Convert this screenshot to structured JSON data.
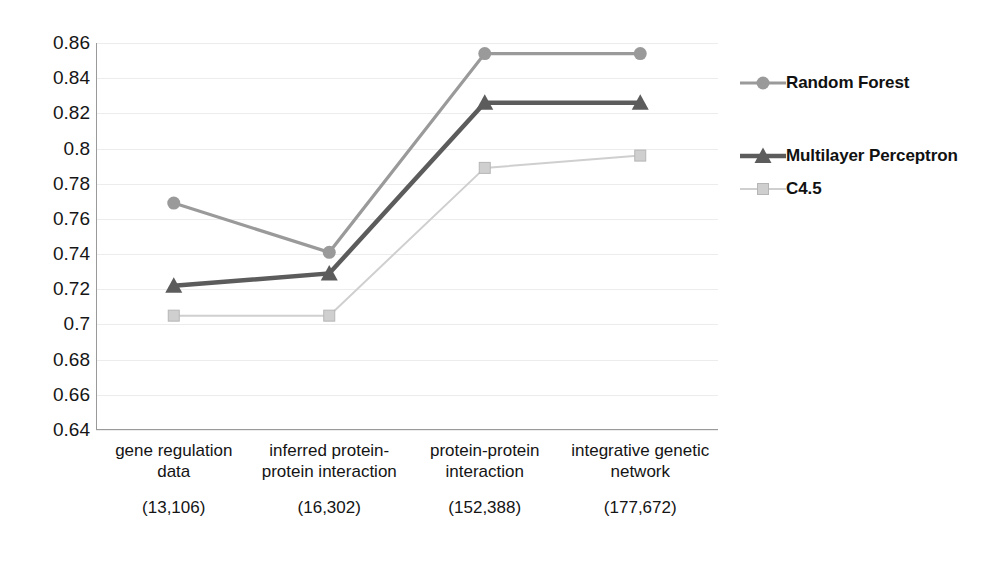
{
  "chart_data": {
    "type": "line",
    "title": "",
    "xlabel": "",
    "ylabel": "",
    "ylim": [
      0.64,
      0.86
    ],
    "yticks": [
      "0.86",
      "0.84",
      "0.82",
      "0.8",
      "0.78",
      "0.76",
      "0.74",
      "0.72",
      "0.7",
      "0.68",
      "0.66",
      "0.64"
    ],
    "ytick_values": [
      0.86,
      0.84,
      0.82,
      0.8,
      0.78,
      0.76,
      0.74,
      0.72,
      0.7,
      0.68,
      0.66,
      0.64
    ],
    "grid": true,
    "legend_position": "right",
    "categories": [
      "gene regulation data",
      "inferred protein-protein interaction",
      "protein-protein interaction",
      "integrative genetic network"
    ],
    "category_labels": [
      {
        "name": "gene regulation data",
        "count": "(13,106)"
      },
      {
        "name": "inferred protein-protein interaction",
        "count": "(16,302)"
      },
      {
        "name": "protein-protein interaction",
        "count": "(152,388)"
      },
      {
        "name": "integrative genetic network",
        "count": "(177,672)"
      }
    ],
    "series": [
      {
        "name": "Random Forest",
        "marker": "circle",
        "color": "#9a9a9a",
        "values": [
          0.769,
          0.741,
          0.854,
          0.854
        ]
      },
      {
        "name": "Multilayer Perceptron",
        "marker": "triangle",
        "color": "#5c5c5c",
        "values": [
          0.722,
          0.729,
          0.826,
          0.826
        ]
      },
      {
        "name": "C4.5",
        "marker": "square",
        "color": "#cfcfcf",
        "values": [
          0.705,
          0.705,
          0.789,
          0.796
        ]
      }
    ]
  },
  "legend": {
    "items": [
      {
        "label": "Random Forest"
      },
      {
        "label": "Multilayer Perceptron"
      },
      {
        "label": "C4.5"
      }
    ]
  },
  "colors": {
    "random_forest": "#9a9a9a",
    "multilayer_perceptron": "#5c5c5c",
    "c45": "#cfcfcf",
    "gridline": "#ececec",
    "axis": "#9a9a9a",
    "text": "#141414"
  }
}
